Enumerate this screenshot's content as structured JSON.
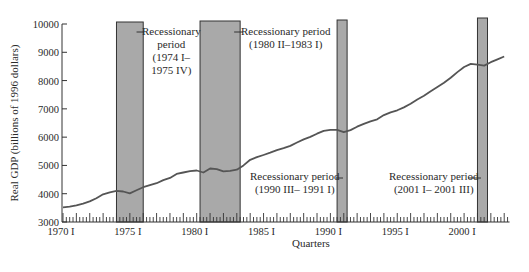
{
  "chart_data": {
    "type": "line",
    "title": "",
    "xlabel": "Quarters",
    "ylabel": "Real GDP (billions of 1996 dollars)",
    "ylim": [
      3000,
      10000
    ],
    "xlim": [
      "1970 I",
      "2003 II"
    ],
    "grid": false,
    "legend": null,
    "yticks": [
      3000,
      4000,
      5000,
      6000,
      7000,
      8000,
      9000,
      10000
    ],
    "ytick_labels": [
      "3000",
      "4000",
      "5000",
      "6000",
      "7000",
      "8000",
      "9000",
      "10000"
    ],
    "xtick_labels": [
      "1970 I",
      "1975 I",
      "1980 I",
      "1985 I",
      "1990 I",
      "1995 I",
      "2000 I"
    ],
    "xtick_years": [
      1970,
      1975,
      1980,
      1985,
      1990,
      1995,
      2000
    ],
    "series": [
      {
        "name": "Real GDP",
        "x": [
          1970.0,
          1970.5,
          1971.0,
          1971.5,
          1972.0,
          1972.5,
          1973.0,
          1973.5,
          1974.0,
          1974.5,
          1975.0,
          1975.5,
          1976.0,
          1976.5,
          1977.0,
          1977.5,
          1978.0,
          1978.5,
          1979.0,
          1979.5,
          1980.0,
          1980.5,
          1981.0,
          1981.5,
          1982.0,
          1982.5,
          1983.0,
          1983.5,
          1984.0,
          1984.5,
          1985.0,
          1985.5,
          1986.0,
          1986.5,
          1987.0,
          1987.5,
          1988.0,
          1988.5,
          1989.0,
          1989.5,
          1990.0,
          1990.5,
          1991.0,
          1991.5,
          1992.0,
          1992.5,
          1993.0,
          1993.5,
          1994.0,
          1994.5,
          1995.0,
          1995.5,
          1996.0,
          1996.5,
          1997.0,
          1997.5,
          1998.0,
          1998.5,
          1999.0,
          1999.5,
          2000.0,
          2000.5,
          2001.0,
          2001.5,
          2002.0,
          2002.5,
          2003.0
        ],
        "values": [
          3520,
          3540,
          3590,
          3650,
          3730,
          3840,
          3980,
          4050,
          4100,
          4080,
          4010,
          4120,
          4230,
          4300,
          4370,
          4480,
          4560,
          4700,
          4750,
          4800,
          4820,
          4750,
          4890,
          4870,
          4790,
          4810,
          4850,
          5000,
          5200,
          5290,
          5370,
          5450,
          5540,
          5610,
          5690,
          5810,
          5920,
          6010,
          6120,
          6220,
          6260,
          6260,
          6180,
          6250,
          6370,
          6470,
          6560,
          6630,
          6780,
          6880,
          6950,
          7050,
          7180,
          7330,
          7460,
          7620,
          7770,
          7920,
          8100,
          8300,
          8480,
          8590,
          8560,
          8530,
          8650,
          8750,
          8850
        ]
      }
    ],
    "shaded_regions": [
      {
        "label": "Recessionary period (1974 I– 1975 IV)",
        "start": 1974.0,
        "end": 1976.0
      },
      {
        "label": "Recessionary period (1980 II–1983 I)",
        "start": 1980.25,
        "end": 1983.25
      },
      {
        "label": "Recessionary period (1990 III– 1991 I)",
        "start": 1990.5,
        "end": 1991.25
      },
      {
        "label": "Recessionary period (2001 I– 2001 III)",
        "start": 2001.0,
        "end": 2001.75
      }
    ]
  },
  "annotations": {
    "rec1": {
      "line1": "Recessionary",
      "line2": "period",
      "line3": "(1974 I–",
      "line4": "1975 IV)"
    },
    "rec2": {
      "line1": "Recessionary period",
      "line2": "(1980 II–1983 I)"
    },
    "rec3": {
      "line1": "Recessionary period",
      "line2": "(1990 III– 1991 I)"
    },
    "rec4": {
      "line1": "Recessionary period",
      "line2": "(2001 I– 2001 III)"
    }
  },
  "colors": {
    "line": "#555555",
    "shade": "#a9a9a9",
    "shade_border": "#333333",
    "axis": "#333333",
    "text": "#2a2a2a"
  }
}
